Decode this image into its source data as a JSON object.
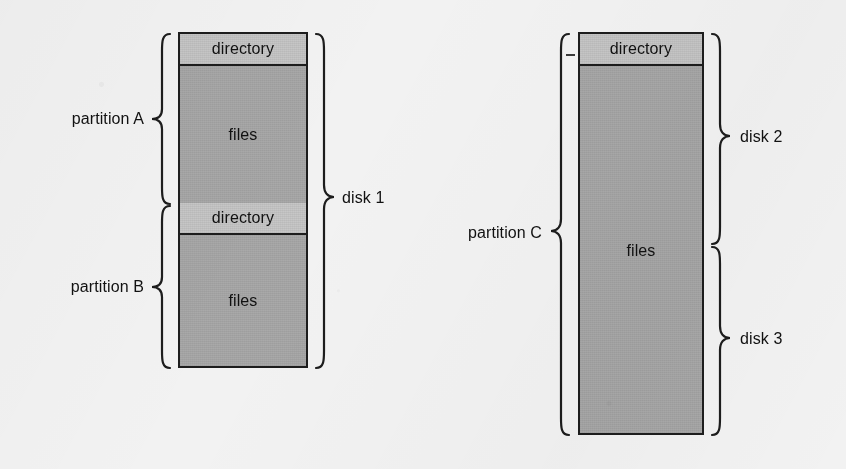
{
  "figure": {
    "background_color": "#f3f2f0",
    "line_color": "#1d1d1d",
    "directory_fill": "#c8c7c5",
    "files_fill": "#a9a9a9",
    "text_color": "#111111"
  },
  "groups": [
    {
      "id": "disk-1",
      "disk_label": "disk 1",
      "partitions": [
        {
          "id": "partition-a",
          "label": "partition A",
          "bands": [
            {
              "type": "directory",
              "label": "directory"
            },
            {
              "type": "files",
              "label": "files"
            }
          ]
        },
        {
          "id": "partition-b",
          "label": "partition B",
          "bands": [
            {
              "type": "directory",
              "label": "directory"
            },
            {
              "type": "files",
              "label": "files"
            }
          ]
        }
      ]
    },
    {
      "id": "disk-2-3",
      "disk_labels": [
        "disk 2",
        "disk 3"
      ],
      "partitions": [
        {
          "id": "partition-c",
          "label": "partition C",
          "bands": [
            {
              "type": "directory",
              "label": "directory"
            },
            {
              "type": "files",
              "label": "files"
            }
          ]
        }
      ]
    }
  ],
  "labels": {
    "partition_a": "partition A",
    "partition_b": "partition B",
    "partition_c": "partition C",
    "disk_1": "disk 1",
    "disk_2": "disk 2",
    "disk_3": "disk 3",
    "directory_a": "directory",
    "files_a": "files",
    "directory_b": "directory",
    "files_b": "files",
    "directory_c": "directory",
    "files_c": "files"
  }
}
